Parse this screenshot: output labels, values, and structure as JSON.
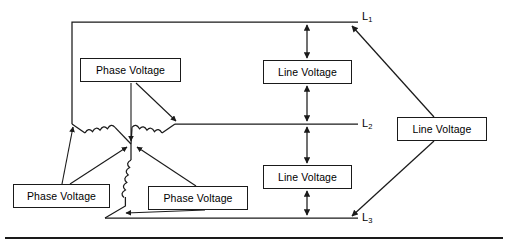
{
  "diagram": {
    "stroke_color": "#1a1a1a",
    "background_color": "#ffffff",
    "boxes": [
      {
        "id": "phase-voltage-top",
        "label": "Phase Voltage",
        "x": 80,
        "y": 58,
        "w": 101,
        "h": 24
      },
      {
        "id": "phase-voltage-left",
        "label": "Phase Voltage",
        "x": 13,
        "y": 184,
        "w": 97,
        "h": 24
      },
      {
        "id": "phase-voltage-right",
        "label": "Phase Voltage",
        "x": 148,
        "y": 186,
        "w": 100,
        "h": 24
      },
      {
        "id": "line-voltage-upper",
        "label": "Line Voltage",
        "x": 263,
        "y": 60,
        "w": 89,
        "h": 24
      },
      {
        "id": "line-voltage-lower",
        "label": "Line Voltage",
        "x": 263,
        "y": 165,
        "w": 89,
        "h": 24
      },
      {
        "id": "line-voltage-right",
        "label": "Line Voltage",
        "x": 397,
        "y": 117,
        "w": 90,
        "h": 24
      }
    ],
    "line_labels": [
      {
        "id": "line-label-l1",
        "text": "L",
        "sub": "1",
        "x": 362,
        "y": 10
      },
      {
        "id": "line-label-l2",
        "text": "L",
        "sub": "2",
        "x": 362,
        "y": 118
      },
      {
        "id": "line-label-l3",
        "text": "L",
        "sub": "3",
        "x": 362,
        "y": 212
      }
    ],
    "conductors": [
      {
        "id": "l1-line",
        "name": "L1 conductor",
        "x1": 72,
        "y1": 22,
        "x2": 358,
        "y2": 22
      },
      {
        "id": "l2-line",
        "name": "L2 conductor",
        "x1": 175,
        "y1": 124,
        "x2": 358,
        "y2": 124
      },
      {
        "id": "l3-line",
        "name": "L3 conductor",
        "x1": 105,
        "y1": 218,
        "x2": 358,
        "y2": 218
      }
    ],
    "star_point": {
      "x": 131,
      "y": 144
    },
    "footer_rule": {
      "y": 238,
      "x1": 5,
      "x2": 503
    }
  }
}
